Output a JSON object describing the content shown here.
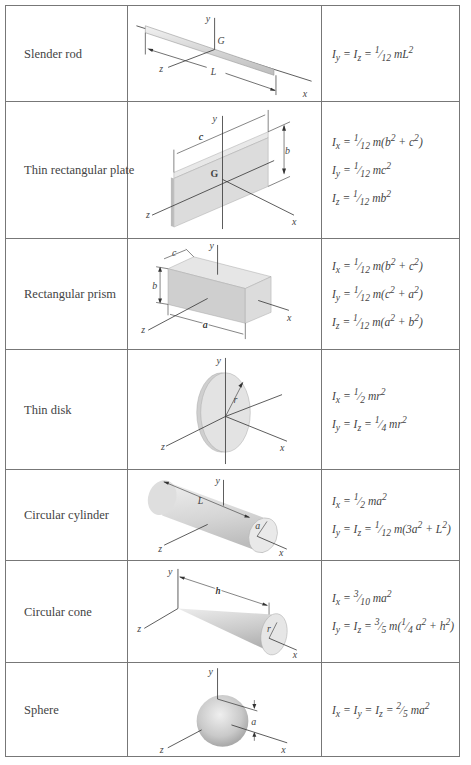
{
  "table": {
    "rows": [
      {
        "name": "Slender rod",
        "labels": {
          "y": "y",
          "G": "G",
          "z": "z",
          "L": "L",
          "x": "x"
        },
        "formulas": [
          "I_y = I_z = 1/12 mL²"
        ]
      },
      {
        "name": "Thin rectangular plate",
        "labels": {
          "y": "y",
          "c": "c",
          "b": "b",
          "G": "G",
          "z": "z",
          "x": "x"
        },
        "formulas": [
          "I_x = 1/12 m(b² + c²)",
          "I_y = 1/12 mc²",
          "I_z = 1/12 mb²"
        ]
      },
      {
        "name": "Rectangular prism",
        "labels": {
          "y": "y",
          "c": "c",
          "b": "b",
          "z": "z",
          "a": "a",
          "x": "x"
        },
        "formulas": [
          "I_x = 1/12 m(b² + c²)",
          "I_y = 1/12 m(c² + a²)",
          "I_z = 1/12 m(a² + b²)"
        ]
      },
      {
        "name": "Thin disk",
        "labels": {
          "y": "y",
          "r": "r",
          "z": "z",
          "x": "x"
        },
        "formulas": [
          "I_x = 1/2 mr²",
          "I_y = I_z = 1/4 mr²"
        ]
      },
      {
        "name": "Circular cylinder",
        "labels": {
          "y": "y",
          "L": "L",
          "a": "a",
          "z": "z",
          "x": "x"
        },
        "formulas": [
          "I_x = 1/2 ma²",
          "I_y = I_z = 1/12 m(3a² + L²)"
        ]
      },
      {
        "name": "Circular cone",
        "labels": {
          "y": "y",
          "h": "h",
          "z": "z",
          "r": "r",
          "x": "x"
        },
        "formulas": [
          "I_x = 3/10 ma²",
          "I_y = I_z = 3/5 m(1/4 a² + h²)"
        ]
      },
      {
        "name": "Sphere",
        "labels": {
          "y": "y",
          "a": "a",
          "z": "z",
          "x": "x"
        },
        "formulas": [
          "I_x = I_y = I_z = 2/5 ma²"
        ]
      }
    ]
  }
}
